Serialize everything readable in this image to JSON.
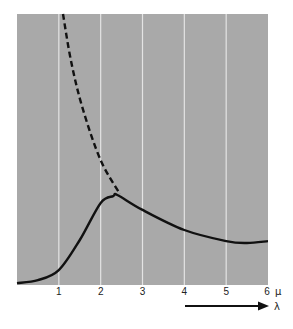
{
  "chart_data": {
    "type": "line",
    "title": "",
    "xlabel": "λ",
    "x_unit": "μ",
    "ylabel": "",
    "xlim": [
      0,
      6
    ],
    "ylim": [
      0,
      100
    ],
    "x_ticks": [
      "1",
      "2",
      "3",
      "4",
      "5",
      "6"
    ],
    "grid": {
      "vertical": true,
      "horizontal": false
    },
    "legend": null,
    "series": [
      {
        "name": "solid-curve",
        "style": "solid",
        "x": [
          0,
          0.5,
          1,
          1.5,
          2,
          2.3,
          2.4,
          3,
          4,
          5,
          5.5,
          6
        ],
        "values": [
          0.7,
          1.8,
          5.5,
          16.6,
          30.3,
          32.8,
          33.2,
          27.7,
          20.3,
          16.2,
          15.5,
          16.2
        ]
      },
      {
        "name": "dashed-curve",
        "style": "dashed",
        "x": [
          1.1,
          1.3,
          1.58,
          2.0,
          2.46
        ],
        "values": [
          100,
          82,
          64.6,
          46,
          33.6
        ]
      }
    ],
    "annotations": [
      {
        "text": "λ",
        "type": "arrow-label",
        "direction": "right"
      }
    ]
  },
  "colors": {
    "plot_background": "#a9a9a9",
    "gridline": "#e4e4e4",
    "curve": "#111111",
    "page_background": "#ffffff"
  }
}
